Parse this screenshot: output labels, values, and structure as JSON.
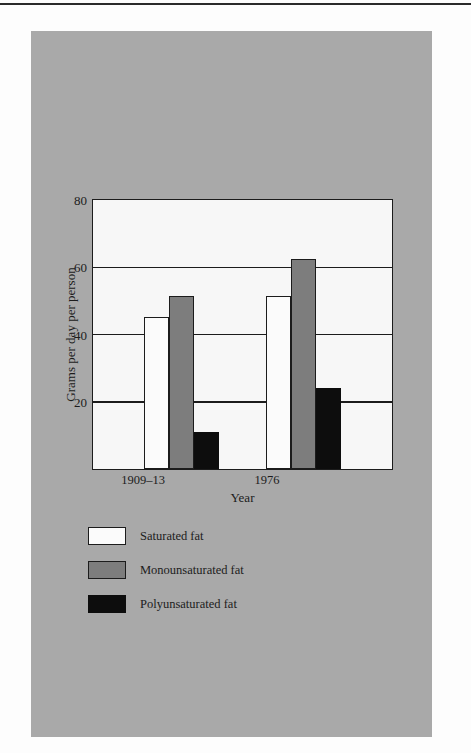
{
  "page": {
    "background_color": "#fdfdfd",
    "panel_color": "#a9a9a9",
    "plot_background_color": "#f7f7f7",
    "ink_color": "#1c1c1c"
  },
  "chart_data": {
    "type": "bar",
    "title": "",
    "xlabel": "Year",
    "ylabel": "Grams per day per person",
    "categories": [
      "1909–13",
      "1976"
    ],
    "series": [
      {
        "name": "Saturated fat",
        "values": [
          45,
          51
        ],
        "color": "#fbfbfb"
      },
      {
        "name": "Monounsaturated fat",
        "values": [
          51,
          62
        ],
        "color": "#7d7d7d"
      },
      {
        "name": "Polyunsaturated fat",
        "values": [
          11,
          24
        ],
        "color": "#0d0d0d"
      }
    ],
    "series_order_note": "bars drawn left-to-right within each group: Saturated, Monounsaturated, Polyunsaturated",
    "bars": [
      {
        "category": "1909–13",
        "series": "Saturated fat",
        "value": 45
      },
      {
        "category": "1909–13",
        "series": "Monounsaturated fat",
        "value": 51
      },
      {
        "category": "1909–13",
        "series": "Polyunsaturated fat",
        "value": 11
      },
      {
        "category": "1976",
        "series": "Saturated fat",
        "value": 55
      },
      {
        "category": "1976",
        "series": "Monounsaturated fat",
        "value": 62
      },
      {
        "category": "1976",
        "series": "Polyunsaturated fat",
        "value": 24
      }
    ],
    "ylim": [
      0,
      80
    ],
    "yticks": [
      20,
      40,
      60,
      80
    ],
    "ytick_labels": [
      "20",
      "40",
      "60",
      "80"
    ],
    "grid": true,
    "grid_axis": "y",
    "legend_position": "below-plot-left",
    "legend_entries": [
      "Saturated fat",
      "Monounsaturated fat",
      "Polyunsaturated fat"
    ]
  },
  "axes": {
    "y_title": "Grams per day per person",
    "x_title": "Year",
    "y_labels": {
      "t80": "80",
      "t60": "60",
      "t40": "40",
      "t20": "20"
    },
    "x_labels": {
      "g1": "1909–13",
      "g2": "1976"
    }
  },
  "legend": {
    "items": [
      {
        "label": "Saturated fat",
        "swatch": "white-swatch"
      },
      {
        "label": "Monounsaturated fat",
        "swatch": "gray-swatch"
      },
      {
        "label": "Polyunsaturated fat",
        "swatch": "black-swatch"
      }
    ]
  }
}
